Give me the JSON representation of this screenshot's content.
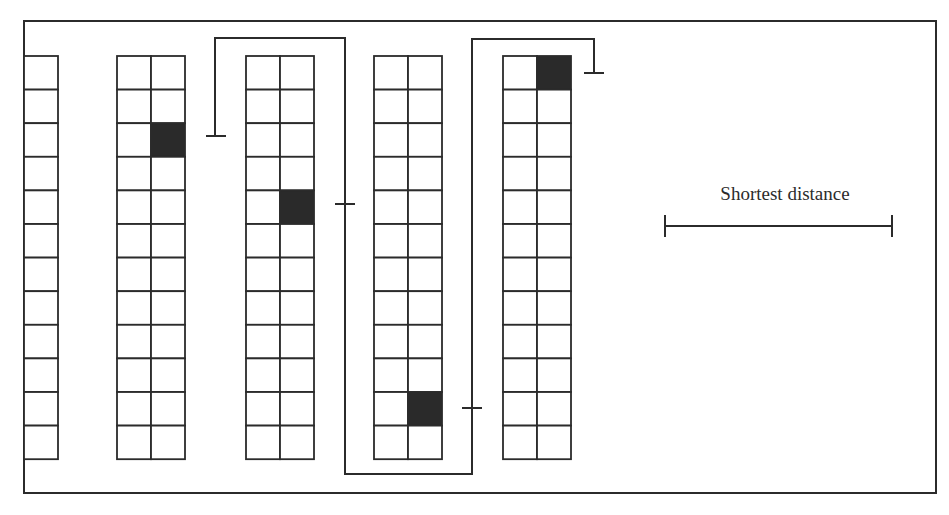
{
  "diagram": {
    "type": "warehouse-picking-route",
    "legend": {
      "label": "Shortest distance",
      "scale_bar": {
        "x1": 665,
        "x2": 892,
        "y": 226
      }
    },
    "colors": {
      "line": "#2b2b2b",
      "picked_cell": "#2a2a2a",
      "background": "#ffffff"
    },
    "frame": {
      "x": 24,
      "y": 21,
      "width": 912,
      "height": 472
    },
    "racks": [
      {
        "id": "rack-1",
        "x": 24,
        "columns": 1,
        "rows": 12,
        "cell_width": 34,
        "picked": []
      },
      {
        "id": "rack-2",
        "x": 117,
        "columns": 2,
        "rows": 12,
        "cell_width": 34,
        "picked": [
          {
            "row": 3,
            "col": 2
          }
        ]
      },
      {
        "id": "rack-3",
        "x": 246,
        "columns": 2,
        "rows": 12,
        "cell_width": 34,
        "picked": [
          {
            "row": 5,
            "col": 2
          }
        ]
      },
      {
        "id": "rack-4",
        "x": 374,
        "columns": 2,
        "rows": 12,
        "cell_width": 34,
        "picked": [
          {
            "row": 11,
            "col": 2
          }
        ]
      },
      {
        "id": "rack-5",
        "x": 503,
        "columns": 2,
        "rows": 12,
        "cell_width": 34,
        "picked": [
          {
            "row": 1,
            "col": 2
          }
        ]
      }
    ],
    "rack_top": 56,
    "row_height": 33.6,
    "route": [
      [
        215,
        136
      ],
      [
        215,
        38
      ],
      [
        345,
        38
      ],
      [
        345,
        474
      ],
      [
        472,
        474
      ],
      [
        472,
        39
      ],
      [
        594,
        39
      ],
      [
        594,
        73
      ]
    ],
    "stop_ticks": [
      {
        "orientation": "horizontal",
        "cx": 216,
        "cy": 136,
        "half": 10
      },
      {
        "orientation": "horizontal",
        "cx": 345,
        "cy": 204,
        "half": 10
      },
      {
        "orientation": "horizontal",
        "cx": 472,
        "cy": 408,
        "half": 10
      },
      {
        "orientation": "horizontal",
        "cx": 594,
        "cy": 73,
        "half": 10
      }
    ]
  }
}
